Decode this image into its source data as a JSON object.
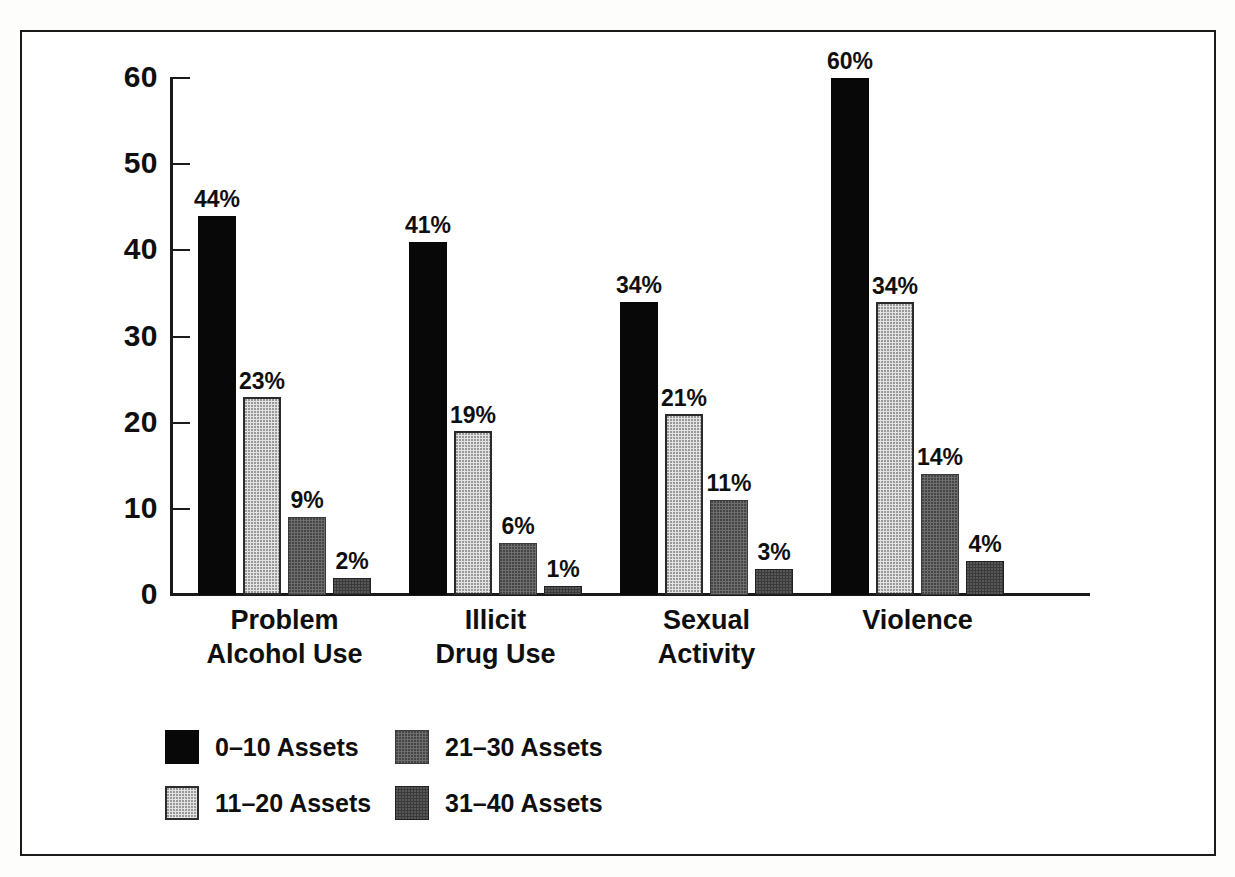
{
  "chart_data": {
    "type": "bar",
    "title": "",
    "subtitle": "",
    "xlabel": "",
    "ylabel": "",
    "ylim": [
      0,
      60
    ],
    "yticks": [
      "0",
      "10",
      "20",
      "30",
      "40",
      "50",
      "60"
    ],
    "grid": false,
    "legend_position": "bottom-left",
    "value_label_suffix": "%",
    "categories": [
      "Problem\nAlcohol Use",
      "Illicit\nDrug Use",
      "Sexual\nActivity",
      "Violence"
    ],
    "series": [
      {
        "name": "0–10 Assets",
        "color": "#080808",
        "values": [
          44,
          41,
          34,
          60
        ],
        "labels": [
          "44%",
          "41%",
          "34%",
          "60%"
        ]
      },
      {
        "name": "11–20 Assets",
        "color": "#e3e3e3",
        "values": [
          23,
          19,
          21,
          34
        ],
        "labels": [
          "23%",
          "19%",
          "21%",
          "34%"
        ]
      },
      {
        "name": "21–30 Assets",
        "color": "#6e6e6e",
        "values": [
          9,
          6,
          11,
          14
        ],
        "labels": [
          "9%",
          "6%",
          "11%",
          "14%"
        ]
      },
      {
        "name": "31–40 Assets",
        "color": "#3a3a3a",
        "values": [
          2,
          1,
          3,
          4
        ],
        "labels": [
          "2%",
          "1%",
          "3%",
          "4%"
        ]
      }
    ]
  },
  "legend": {
    "entries": [
      {
        "label": "0–10 Assets"
      },
      {
        "label": "11–20 Assets"
      },
      {
        "label": "21–30 Assets"
      },
      {
        "label": "31–40 Assets"
      }
    ]
  },
  "axis": {
    "y_ticks": [
      {
        "label": "60",
        "value": 60
      },
      {
        "label": "50",
        "value": 50
      },
      {
        "label": "40",
        "value": 40
      },
      {
        "label": "30",
        "value": 30
      },
      {
        "label": "20",
        "value": 20
      },
      {
        "label": "10",
        "value": 10
      },
      {
        "label": "0",
        "value": 0
      }
    ]
  }
}
